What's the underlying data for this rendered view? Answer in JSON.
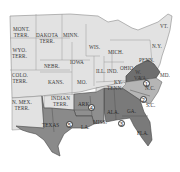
{
  "map": {
    "colors": {
      "background": "#ffffff",
      "union_state": "#e2e2e2",
      "border": "#8a8a8a",
      "district_dark": "#7d7d7d",
      "district_medium": "#a3a3a3",
      "district_light": "#b8b8b8"
    },
    "labels": [
      {
        "id": "mont",
        "text": "MONT.\nTERR."
      },
      {
        "id": "dakota",
        "text": "DAKOTA\nTERR."
      },
      {
        "id": "minn",
        "text": "MINN."
      },
      {
        "id": "wis",
        "text": "WIS."
      },
      {
        "id": "mich",
        "text": "MICH."
      },
      {
        "id": "vt",
        "text": "VT."
      },
      {
        "id": "ny",
        "text": "N.Y."
      },
      {
        "id": "wyo",
        "text": "WYO.\nTERR."
      },
      {
        "id": "nebr",
        "text": "NEBR."
      },
      {
        "id": "iowa",
        "text": "IOWA"
      },
      {
        "id": "penn",
        "text": "PENN."
      },
      {
        "id": "ohio",
        "text": "OHIO"
      },
      {
        "id": "ill",
        "text": "ILL."
      },
      {
        "id": "ind",
        "text": "IND."
      },
      {
        "id": "colo",
        "text": "COLO.\nTERR."
      },
      {
        "id": "kans",
        "text": "KANS."
      },
      {
        "id": "mo",
        "text": "MO."
      },
      {
        "id": "ky",
        "text": "KY."
      },
      {
        "id": "wv",
        "text": "W.\nVA."
      },
      {
        "id": "va",
        "text": "VA."
      },
      {
        "id": "md",
        "text": "MD."
      },
      {
        "id": "tenn",
        "text": "TENN."
      },
      {
        "id": "nc",
        "text": "N.C."
      },
      {
        "id": "sc",
        "text": "S.C."
      },
      {
        "id": "nmex",
        "text": "N. MEX.\nTERR."
      },
      {
        "id": "indian",
        "text": "INDIAN\nTERR."
      },
      {
        "id": "ark",
        "text": "ARK."
      },
      {
        "id": "ala",
        "text": "ALA."
      },
      {
        "id": "ga",
        "text": "GA."
      },
      {
        "id": "texas",
        "text": "TEXAS"
      },
      {
        "id": "la",
        "text": "LA."
      },
      {
        "id": "miss",
        "text": "MISS."
      },
      {
        "id": "fla",
        "text": "FLA."
      }
    ],
    "district_markers": [
      {
        "id": "d1",
        "number": "1"
      },
      {
        "id": "d2",
        "number": "2"
      },
      {
        "id": "d3",
        "number": "3"
      },
      {
        "id": "d4",
        "number": "4"
      },
      {
        "id": "d5",
        "number": "5"
      }
    ]
  }
}
